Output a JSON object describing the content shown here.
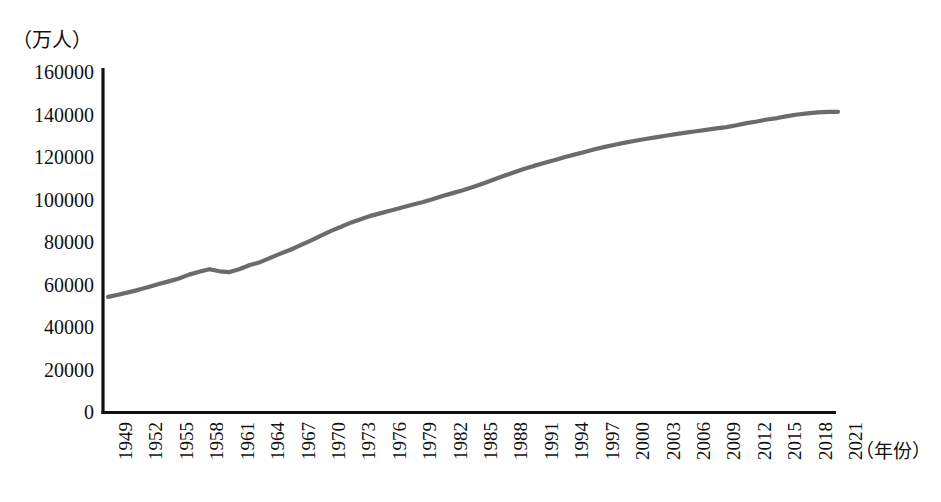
{
  "chart_data": {
    "type": "line",
    "title": "",
    "subtitle": "",
    "unit_label": "（万人）",
    "xlabel": "（年份）",
    "ylabel": "（万人）",
    "grid": false,
    "legend": null,
    "legend_position": "none",
    "line_color": "#6b6b6b",
    "axis_color": "#111111",
    "xlim": [
      1949,
      2021
    ],
    "ylim": [
      0,
      160000
    ],
    "ytick_labels": [
      "160000",
      "140000",
      "120000",
      "100000",
      "80000",
      "60000",
      "40000",
      "20000",
      "0"
    ],
    "ytick_values": [
      160000,
      140000,
      120000,
      100000,
      80000,
      60000,
      40000,
      20000,
      0
    ],
    "xtick_labels": [
      "1949",
      "1952",
      "1955",
      "1958",
      "1961",
      "1964",
      "1967",
      "1970",
      "1973",
      "1976",
      "1979",
      "1982",
      "1985",
      "1988",
      "1991",
      "1994",
      "1997",
      "2000",
      "2003",
      "2006",
      "2009",
      "2012",
      "2015",
      "2018",
      "2021"
    ],
    "xtick_values": [
      1949,
      1952,
      1955,
      1958,
      1961,
      1964,
      1967,
      1970,
      1973,
      1976,
      1979,
      1982,
      1985,
      1988,
      1991,
      1994,
      1997,
      2000,
      2003,
      2006,
      2009,
      2012,
      2015,
      2018,
      2021
    ],
    "series": [
      {
        "name": "年末总人口",
        "x": [
          1949,
          1950,
          1951,
          1952,
          1953,
          1954,
          1955,
          1956,
          1957,
          1958,
          1959,
          1960,
          1961,
          1962,
          1963,
          1964,
          1965,
          1966,
          1967,
          1968,
          1969,
          1970,
          1971,
          1972,
          1973,
          1974,
          1975,
          1976,
          1977,
          1978,
          1979,
          1980,
          1981,
          1982,
          1983,
          1984,
          1985,
          1986,
          1987,
          1988,
          1989,
          1990,
          1991,
          1992,
          1993,
          1994,
          1995,
          1996,
          1997,
          1998,
          1999,
          2000,
          2001,
          2002,
          2003,
          2004,
          2005,
          2006,
          2007,
          2008,
          2009,
          2010,
          2011,
          2012,
          2013,
          2014,
          2015,
          2016,
          2017,
          2018,
          2019,
          2020,
          2021
        ],
        "values": [
          54167,
          55196,
          56300,
          57482,
          58796,
          60266,
          61465,
          62828,
          64653,
          65994,
          67207,
          66207,
          65859,
          67295,
          69172,
          70499,
          72538,
          74542,
          76368,
          78534,
          80671,
          82992,
          85229,
          87177,
          89211,
          90859,
          92420,
          93717,
          94974,
          96259,
          97542,
          98705,
          100072,
          101654,
          103008,
          104357,
          105851,
          107507,
          109300,
          111026,
          112704,
          114333,
          115823,
          117171,
          118517,
          119850,
          121121,
          122389,
          123626,
          124761,
          125786,
          126743,
          127627,
          128453,
          129227,
          129988,
          130756,
          131448,
          132129,
          132802,
          133450,
          134091,
          134916,
          135922,
          136726,
          137646,
          138326,
          139232,
          140011,
          140541,
          141008,
          141212,
          141260
        ],
        "unit": "万人"
      }
    ]
  },
  "axis": {
    "origin_value": "0",
    "y_max_value": "160000"
  }
}
